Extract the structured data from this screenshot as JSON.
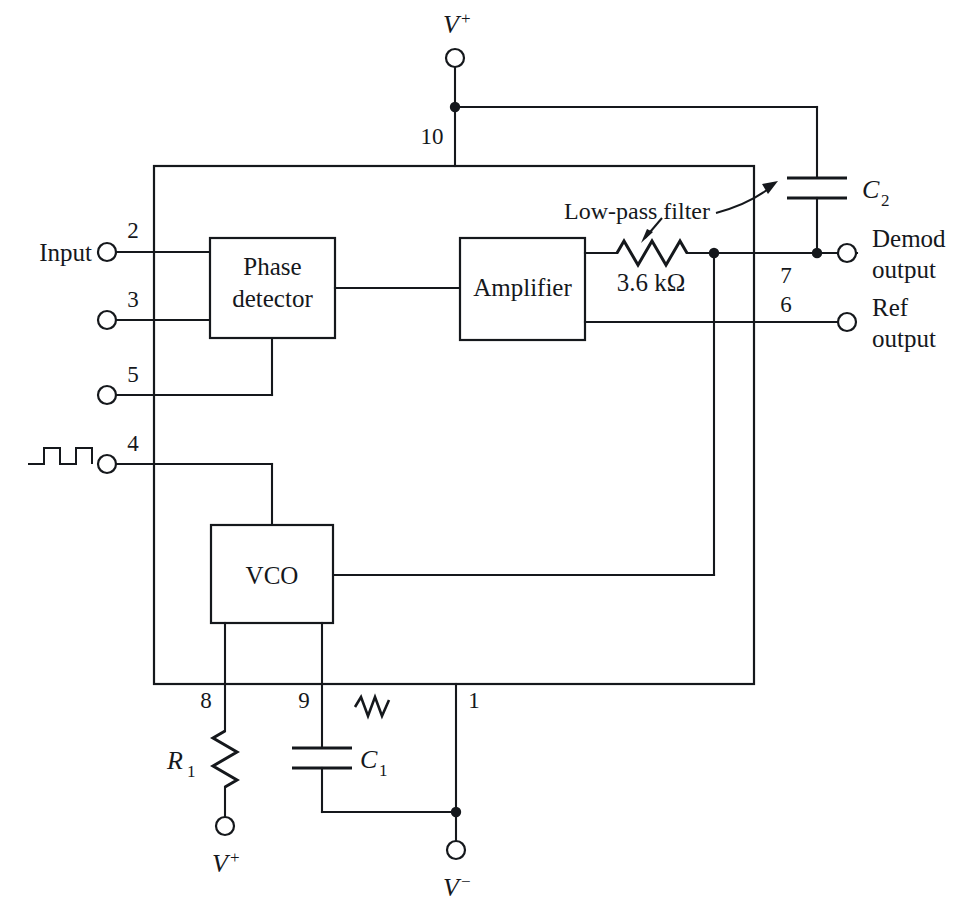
{
  "diagram": {
    "type": "schematic",
    "blocks": [
      {
        "id": "phase_detector",
        "label_line1": "Phase",
        "label_line2": "detector"
      },
      {
        "id": "amplifier",
        "label_line1": "Amplifier",
        "label_line2": ""
      },
      {
        "id": "vco",
        "label_line1": "VCO",
        "label_line2": ""
      }
    ],
    "pins": [
      {
        "number": "10",
        "net": "V+ supply"
      },
      {
        "number": "2",
        "net": "Input"
      },
      {
        "number": "3",
        "net": "Input return"
      },
      {
        "number": "5",
        "net": "Phase detector"
      },
      {
        "number": "4",
        "net": "VCO square wave"
      },
      {
        "number": "7",
        "net": "Demod output"
      },
      {
        "number": "6",
        "net": "Ref output"
      },
      {
        "number": "8",
        "net": "R1 timing"
      },
      {
        "number": "9",
        "net": "C1 timing"
      },
      {
        "number": "1",
        "net": "V- supply"
      }
    ],
    "terminals": [
      {
        "id": "vplus_top",
        "label": "V",
        "sup": "+"
      },
      {
        "id": "input",
        "label": "Input",
        "sup": ""
      },
      {
        "id": "demod_out",
        "label_line1": "Demod",
        "label_line2": "output"
      },
      {
        "id": "ref_out",
        "label_line1": "Ref",
        "label_line2": "output"
      },
      {
        "id": "vplus_bottom",
        "label": "V",
        "sup": "+"
      },
      {
        "id": "vminus_bottom",
        "label": "V",
        "sup": "−"
      }
    ],
    "components": [
      {
        "id": "r_filter",
        "label": "3.6 kΩ",
        "kind": "resistor"
      },
      {
        "id": "c2",
        "label": "C",
        "sub": "2",
        "kind": "capacitor"
      },
      {
        "id": "r1",
        "label": "R",
        "sub": "1",
        "kind": "resistor"
      },
      {
        "id": "c1",
        "label": "C",
        "sub": "1",
        "kind": "capacitor"
      }
    ],
    "annotations": [
      {
        "id": "lowpass",
        "text": "Low-pass filter",
        "points_to": [
          "r_filter",
          "c2"
        ]
      }
    ],
    "colors": {
      "ink": "#15181c",
      "background": "#ffffff"
    }
  },
  "labels": {
    "phase_detector_1": "Phase",
    "phase_detector_2": "detector",
    "amplifier": "Amplifier",
    "vco": "VCO",
    "input": "Input",
    "demod_1": "Demod",
    "demod_2": "output",
    "ref_1": "Ref",
    "ref_2": "output",
    "lowpass_filter": "Low-pass filter",
    "res_value": "3.6 kΩ",
    "c2_main": "C",
    "c2_sub": "2",
    "c1_main": "C",
    "c1_sub": "1",
    "r1_main": "R",
    "r1_sub": "1",
    "v_main": "V",
    "v_plus": "+",
    "v_minus": "−",
    "pin1": "1",
    "pin2": "2",
    "pin3": "3",
    "pin4": "4",
    "pin5": "5",
    "pin6": "6",
    "pin7": "7",
    "pin8": "8",
    "pin9": "9",
    "pin10": "10"
  }
}
